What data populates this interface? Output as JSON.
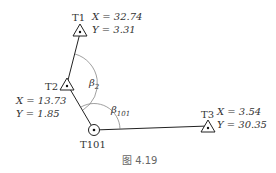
{
  "figure": {
    "caption": "图 4.19",
    "stations": [
      {
        "id": "T1",
        "name": "T1",
        "type": "triangle",
        "x_label": "X = 32.74",
        "y_label": "Y = 3.31"
      },
      {
        "id": "T2",
        "name": "T2",
        "type": "triangle",
        "x_label": "X = 13.73",
        "y_label": "Y = 1.85"
      },
      {
        "id": "T101",
        "name": "T101",
        "type": "circle"
      },
      {
        "id": "T3",
        "name": "T3",
        "type": "triangle",
        "x_label": "X = 3.54",
        "y_label": "Y = 30.35"
      }
    ],
    "angles": [
      {
        "id": "beta2",
        "symbol": "β",
        "subscript": "2"
      },
      {
        "id": "beta101",
        "symbol": "β",
        "subscript": "101"
      }
    ],
    "edges": [
      [
        "T1",
        "T2"
      ],
      [
        "T2",
        "T101"
      ],
      [
        "T101",
        "T3"
      ]
    ]
  }
}
